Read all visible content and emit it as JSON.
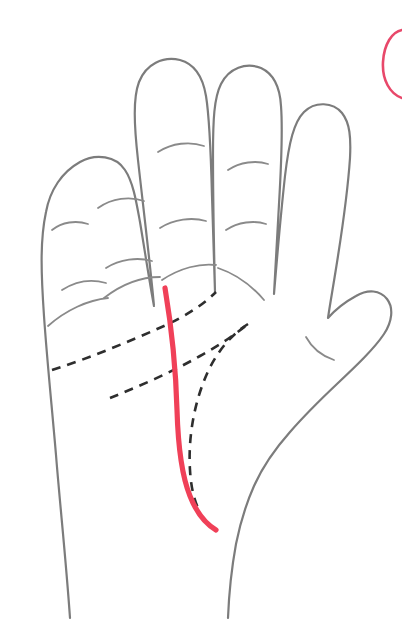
{
  "figure": {
    "background_color": "#ffffff",
    "width": 402,
    "height": 630
  },
  "colors": {
    "hand_outline": "#7c7c7c",
    "finger_crease": "#8a8a8a",
    "palm_line_dashed": "#2e2e2e",
    "highlight_red": "#f04058",
    "corner_marker": "#e8486a",
    "background": "#ffffff"
  },
  "strokes": {
    "hand_outline_width": 2.2,
    "finger_crease_width": 1.8,
    "palm_line_width": 2.6,
    "palm_line_dash": "9 7",
    "highlight_width": 5.2,
    "corner_marker_width": 2.6
  },
  "hand": {
    "name": "left-palm-outline",
    "orientation": "palm-facing-viewer",
    "outline_path": "M 70 618 C 66 560 60 505 56 455 C 52 408 47 360 44 316 C 41 272 40 240 46 212 C 50 190 62 172 80 162 C 96 153 116 156 125 170 C 133 182 136 200 140 222 C 145 252 150 285 154 306 C 150 262 143 205 138 160 C 134 124 133 98 139 82 C 146 64 163 56 180 60 C 195 64 203 78 206 96 C 210 120 211 158 212 196 C 213 232 214 268 215 292 C 214 250 213 196 213 154 C 213 120 214 98 221 84 C 229 68 246 62 261 68 C 274 74 280 88 281 106 C 283 132 281 170 279 204 C 277 240 275 272 274 294 C 277 258 281 212 285 176 C 289 142 294 122 304 112 C 315 101 333 102 342 113 C 350 123 351 138 350 158 C 348 188 343 224 338 256 C 334 282 330 304 328 318 C 335 310 345 302 356 296 C 368 289 380 290 387 299 C 394 308 392 322 384 334 C 374 349 356 366 338 383 C 320 400 303 417 290 432 C 274 450 262 468 254 486 C 246 504 240 524 236 544 C 232 566 229 592 228 618",
    "parts": [
      {
        "name": "pinky-finger",
        "label": "pinky"
      },
      {
        "name": "ring-finger",
        "label": "ring"
      },
      {
        "name": "middle-finger",
        "label": "middle"
      },
      {
        "name": "index-finger",
        "label": "index"
      },
      {
        "name": "thumb",
        "label": "thumb"
      },
      {
        "name": "palm",
        "label": "palm"
      },
      {
        "name": "wrist",
        "label": "wrist"
      }
    ]
  },
  "finger_creases": [
    {
      "name": "pinky-upper-crease",
      "path": "M 52 230 C 62 222 76 220 88 224"
    },
    {
      "name": "pinky-lower-crease",
      "path": "M 62 290 C 76 281 92 279 106 283"
    },
    {
      "name": "ring-upper-crease",
      "path": "M 98 208 C 112 198 130 196 144 201"
    },
    {
      "name": "ring-lower-crease",
      "path": "M 106 268 C 120 259 138 257 152 261"
    },
    {
      "name": "middle-upper-crease",
      "path": "M 158 152 C 172 143 190 141 204 146"
    },
    {
      "name": "middle-lower-crease",
      "path": "M 160 228 C 174 219 192 217 206 221"
    },
    {
      "name": "index-upper-crease",
      "path": "M 228 170 C 240 162 256 160 268 164"
    },
    {
      "name": "index-lower-crease",
      "path": "M 226 230 C 238 222 254 220 266 224"
    },
    {
      "name": "thumb-crease",
      "path": "M 306 337 C 312 348 322 356 334 360"
    }
  ],
  "knuckle_creases": [
    {
      "name": "pinky-base-crease",
      "path": "M 48 326 C 66 310 88 300 108 298"
    },
    {
      "name": "ring-base-crease",
      "path": "M 104 298 C 122 284 142 277 160 277"
    },
    {
      "name": "middle-base-crease",
      "path": "M 162 280 C 180 268 200 263 216 265"
    },
    {
      "name": "index-base-crease",
      "path": "M 218 268 C 236 274 252 286 264 300"
    }
  ],
  "palm_lines": [
    {
      "name": "heart-line",
      "label": "Heart line",
      "style": "dashed",
      "path": "M 52 370 C 90 358 130 341 164 326 C 186 316 204 304 216 292"
    },
    {
      "name": "head-line",
      "label": "Head line",
      "style": "dashed",
      "path": "M 110 398 C 140 386 172 372 200 356 C 222 344 238 332 248 324"
    },
    {
      "name": "life-line",
      "label": "Life line",
      "style": "dashed",
      "path": "M 248 324 C 232 334 216 352 206 376 C 194 404 188 438 190 470 C 191 489 195 503 200 512"
    }
  ],
  "highlighted_line": {
    "name": "fate-line",
    "label": "Fate line",
    "color": "#f04058",
    "style": "solid",
    "path": "M 165 288 C 172 330 176 372 177 410 C 178 444 181 474 190 496 C 197 514 206 524 216 530"
  },
  "corner_marker": {
    "name": "corner-circle-marker",
    "label": "Partial circle outline at top-right edge",
    "path": "M 402 30 C 392 32 384 44 383 62 C 382 80 390 94 402 98",
    "color": "#e8486a"
  }
}
